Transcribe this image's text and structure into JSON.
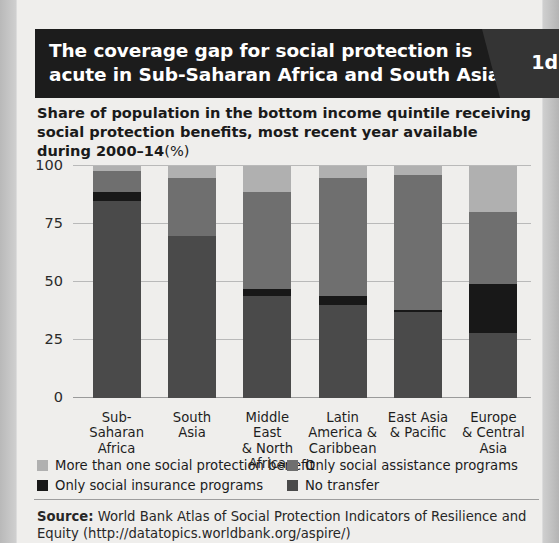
{
  "figure": {
    "number": "1d",
    "title_line1": "The coverage gap for social protection is",
    "title_line2": "acute in Sub-Saharan Africa and South Asia",
    "subtitle_main": "Share of population in the bottom income quintile receiving social protection benefits, most recent year available during 2000–14",
    "subtitle_unit": "(%)",
    "source_label": "Source:",
    "source_line1": " World Bank Atlas of Social Protection Indicators of Resilience and",
    "source_line2": "Equity (http://datatopics.worldbank.org/aspire/)"
  },
  "colors": {
    "more_than_one": "#b0b0b0",
    "only_assistance": "#6f6f6f",
    "only_insurance": "#181818",
    "no_transfer": "#4a4a4a",
    "title_bar": "#1c1c1c",
    "figure_number_bg": "#343434",
    "panel_bg": "#efeeec",
    "gridline": "#b9b9b9"
  },
  "chart_data": {
    "type": "bar",
    "stacked": true,
    "xlabel": "",
    "ylabel": "",
    "ylim": [
      0,
      100
    ],
    "yticks": [
      0,
      25,
      50,
      75,
      100
    ],
    "ytick_labels": [
      "0",
      "25",
      "50",
      "75",
      "100"
    ],
    "grid": true,
    "legend_position": "bottom",
    "categories": [
      "Sub-Saharan\nAfrica",
      "South\nAsia",
      "Middle East\n& North\nAfrica",
      "Latin\nAmerica &\nCaribbean",
      "East Asia\n& Pacific",
      "Europe\n& Central\nAsia"
    ],
    "series": [
      {
        "name": "No transfer",
        "color": "#4a4a4a",
        "values": [
          85,
          70,
          44,
          40,
          37,
          28
        ]
      },
      {
        "name": "Only social insurance programs",
        "color": "#181818",
        "values": [
          4,
          0,
          3,
          4,
          1,
          21
        ]
      },
      {
        "name": "Only social assistance programs",
        "color": "#6f6f6f",
        "values": [
          9,
          25,
          42,
          51,
          58,
          31
        ]
      },
      {
        "name": "More than one social protection benefit",
        "color": "#b0b0b0",
        "values": [
          2,
          5,
          11,
          5,
          4,
          20
        ]
      }
    ]
  },
  "legend": {
    "items": [
      {
        "label": "More than one social protection benefit",
        "color": "#b0b0b0",
        "swatch": "more-than-one-swatch"
      },
      {
        "label": "Only social assistance programs",
        "color": "#6f6f6f",
        "swatch": "only-assistance-swatch"
      },
      {
        "label": "Only social insurance programs",
        "color": "#181818",
        "swatch": "only-insurance-swatch"
      },
      {
        "label": "No transfer",
        "color": "#4a4a4a",
        "swatch": "no-transfer-swatch"
      }
    ]
  }
}
